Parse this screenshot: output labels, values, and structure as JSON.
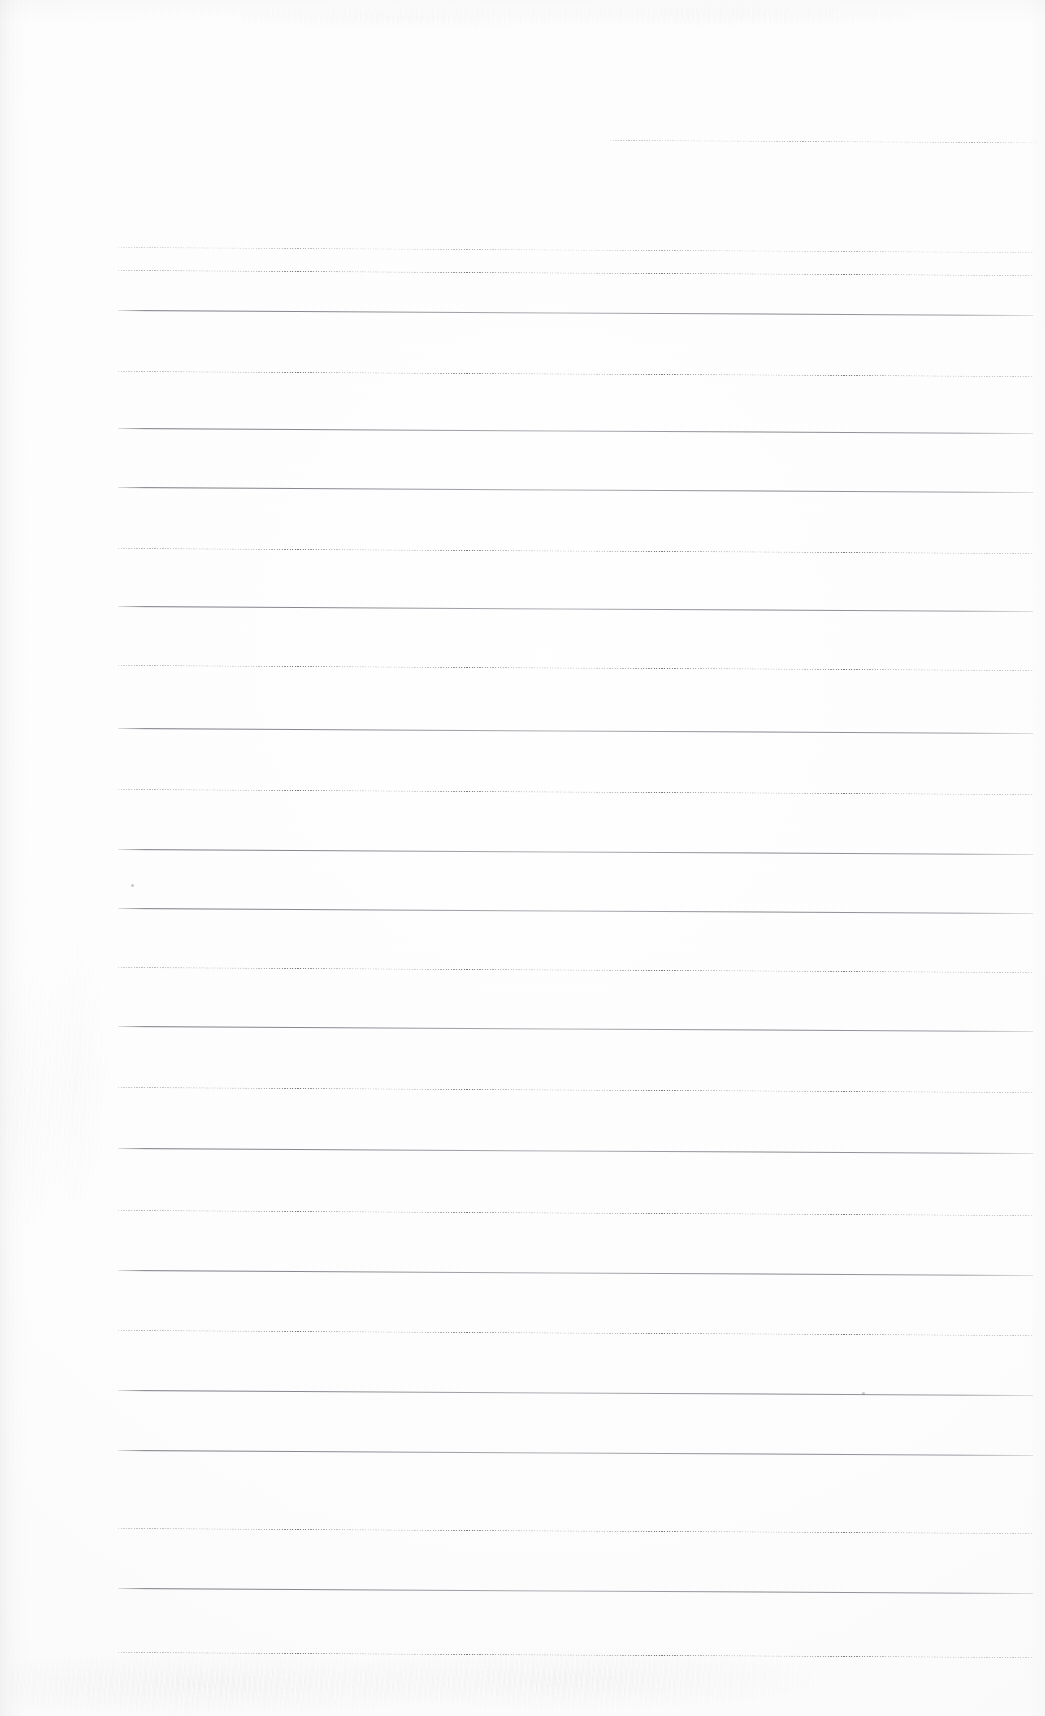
{
  "document": {
    "kind": "scanned-ruled-paper",
    "title": "Blank ruled notebook page (scan)",
    "page_width": 1045,
    "page_height": 1716,
    "background_color": "#fdfdfd",
    "rule_color": "#6a6c72",
    "content_text": "",
    "has_handwriting": false,
    "notes": "Empty lined sheet; only horizontal ruling lines and scanner artefacts are visible."
  },
  "ruling": {
    "line_count": 23,
    "line_spacing_px": 65.5,
    "left_margin_x": 118,
    "right_margin_x": 1033,
    "first_line_left_x": 610,
    "slope_px_over_width": 5,
    "lines": [
      {
        "index": 1,
        "y": 140,
        "x1": 610,
        "x2": 1037,
        "style": "dotted",
        "weight": "faint"
      },
      {
        "index": 2,
        "y": 247,
        "x1": 118,
        "x2": 1033,
        "style": "dotted",
        "weight": "faint"
      },
      {
        "index": 3,
        "y": 270,
        "x1": 118,
        "x2": 1033,
        "style": "dotted",
        "weight": "heavy"
      },
      {
        "index": 4,
        "y": 310,
        "x1": 118,
        "x2": 1033,
        "style": "solid",
        "weight": "heavy"
      },
      {
        "index": 5,
        "y": 371,
        "x1": 118,
        "x2": 1033,
        "style": "dotted",
        "weight": "heavy"
      },
      {
        "index": 6,
        "y": 428,
        "x1": 118,
        "x2": 1033,
        "style": "solid",
        "weight": "heavy"
      },
      {
        "index": 7,
        "y": 487,
        "x1": 118,
        "x2": 1033,
        "style": "solid",
        "weight": "heavy"
      },
      {
        "index": 8,
        "y": 548,
        "x1": 118,
        "x2": 1033,
        "style": "dotted",
        "weight": "heavy"
      },
      {
        "index": 9,
        "y": 606,
        "x1": 118,
        "x2": 1033,
        "style": "solid",
        "weight": "heavy"
      },
      {
        "index": 10,
        "y": 665,
        "x1": 118,
        "x2": 1033,
        "style": "dotted",
        "weight": "heavy"
      },
      {
        "index": 11,
        "y": 728,
        "x1": 118,
        "x2": 1033,
        "style": "solid",
        "weight": "heavy"
      },
      {
        "index": 12,
        "y": 789,
        "x1": 118,
        "x2": 1033,
        "style": "dotted",
        "weight": "heavy"
      },
      {
        "index": 13,
        "y": 849,
        "x1": 118,
        "x2": 1033,
        "style": "solid",
        "weight": "heavy"
      },
      {
        "index": 14,
        "y": 908,
        "x1": 118,
        "x2": 1033,
        "style": "solid",
        "weight": "heavy"
      },
      {
        "index": 15,
        "y": 967,
        "x1": 118,
        "x2": 1033,
        "style": "dotted",
        "weight": "heavy"
      },
      {
        "index": 16,
        "y": 1026,
        "x1": 118,
        "x2": 1033,
        "style": "solid",
        "weight": "heavy"
      },
      {
        "index": 17,
        "y": 1087,
        "x1": 118,
        "x2": 1033,
        "style": "dotted",
        "weight": "heavy"
      },
      {
        "index": 18,
        "y": 1148,
        "x1": 118,
        "x2": 1033,
        "style": "solid",
        "weight": "heavy"
      },
      {
        "index": 19,
        "y": 1210,
        "x1": 118,
        "x2": 1033,
        "style": "dotted",
        "weight": "heavy"
      },
      {
        "index": 20,
        "y": 1270,
        "x1": 118,
        "x2": 1033,
        "style": "solid",
        "weight": "heavy"
      },
      {
        "index": 21,
        "y": 1330,
        "x1": 118,
        "x2": 1033,
        "style": "dotted",
        "weight": "heavy"
      },
      {
        "index": 22,
        "y": 1390,
        "x1": 118,
        "x2": 1033,
        "style": "solid",
        "weight": "heavy"
      },
      {
        "index": 23,
        "y": 1450,
        "x1": 118,
        "x2": 1033,
        "style": "solid",
        "weight": "heavy"
      },
      {
        "index": 24,
        "y": 1528,
        "x1": 118,
        "x2": 1033,
        "style": "dotted",
        "weight": "heavy"
      },
      {
        "index": 25,
        "y": 1588,
        "x1": 118,
        "x2": 1033,
        "style": "solid",
        "weight": "heavy"
      },
      {
        "index": 26,
        "y": 1652,
        "x1": 118,
        "x2": 1033,
        "style": "dotted",
        "weight": "heavy"
      }
    ]
  },
  "artifacts": {
    "specks": [
      {
        "x": 862,
        "y": 1392
      },
      {
        "x": 131,
        "y": 884
      }
    ],
    "bleed_through": true,
    "edge_shadow_left": true
  }
}
